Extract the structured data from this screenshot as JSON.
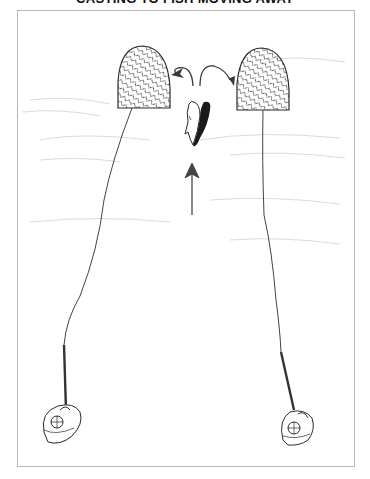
{
  "diagram": {
    "title": "CASTING TO FISH MOVING AWAY",
    "elements": {
      "left_target_zone": "hatched cast landing zone (left)",
      "right_target_zone": "hatched cast landing zone (right)",
      "fish": "two fish swimming away (one light, one dark shadow)",
      "direction_arrow": "arrow indicating fish travel direction (upstream/away)",
      "curved_arrows": "arrows showing fish may turn left or right",
      "left_angler": "angler with rod at lower left",
      "right_angler": "angler with rod at lower right"
    },
    "colors": {
      "ink": "#2a2a2a",
      "frame": "#b8b8b8",
      "background": "#ffffff",
      "water_texture": "#d8d8d8"
    }
  }
}
